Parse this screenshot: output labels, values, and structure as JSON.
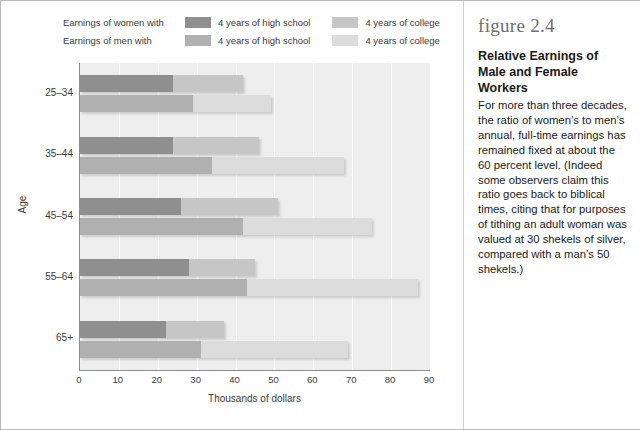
{
  "legend": {
    "rows": [
      {
        "lead": "Earnings of women with",
        "swatch_hs": "#8f8f8f",
        "label_hs": "4 years of high school",
        "swatch_col": "#c6c6c6",
        "label_col": "4 years of college"
      },
      {
        "lead": "Earnings of men with",
        "swatch_hs": "#b0b0b0",
        "label_hs": "4 years of high school",
        "swatch_col": "#dcdcdc",
        "label_col": "4 years of college"
      }
    ]
  },
  "axes": {
    "y_title": "Age",
    "x_title": "Thousands of dollars",
    "x_ticks": [
      "0",
      "10",
      "20",
      "30",
      "40",
      "50",
      "60",
      "70",
      "80",
      "90"
    ],
    "y_ticks": [
      "25–34",
      "35–44",
      "45–54",
      "55–64",
      "65+"
    ]
  },
  "caption": {
    "figure_number": "figure 2.4",
    "title": "Relative Earnings of Male and Female Workers",
    "body": "For more than three decades, the ratio of women’s to men’s annual, full-time earnings has remained fixed at about the 60 percent level. (Indeed some observers claim this ratio goes back to biblical times, citing that for purposes of tithing an adult woman was valued at 30 shekels of silver, compared with a man’s 50 shekels.)"
  },
  "chart_data": {
    "type": "bar",
    "orientation": "horizontal",
    "stacked": true,
    "title": "Relative Earnings of Male and Female Workers",
    "xlabel": "Thousands of dollars",
    "ylabel": "Age",
    "xlim": [
      0,
      90
    ],
    "xticks": [
      0,
      10,
      20,
      30,
      40,
      50,
      60,
      70,
      80,
      90
    ],
    "grid": "vertical",
    "legend_position": "top",
    "categories": [
      "25–34",
      "35–44",
      "45–54",
      "55–64",
      "65+"
    ],
    "series": [
      {
        "name": "Earnings of women with 4 years of high school",
        "group": "women",
        "segment": "high-school",
        "color": "#8f8f8f",
        "values": [
          24,
          24,
          26,
          28,
          22
        ]
      },
      {
        "name": "Earnings of women with 4 years of college",
        "group": "women",
        "segment": "college",
        "color": "#c6c6c6",
        "values": [
          42,
          46,
          51,
          45,
          37
        ]
      },
      {
        "name": "Earnings of men with 4 years of high school",
        "group": "men",
        "segment": "high-school",
        "color": "#b0b0b0",
        "values": [
          29,
          34,
          42,
          43,
          31
        ]
      },
      {
        "name": "Earnings of men with 4 years of college",
        "group": "men",
        "segment": "college",
        "color": "#dcdcdc",
        "values": [
          49,
          68,
          75,
          87,
          69
        ]
      }
    ]
  },
  "colors": {
    "plot_background": "#eeeeee",
    "gridline": "#ffffff",
    "axis": "#8c8c8c",
    "text": "#3b3b3b"
  }
}
